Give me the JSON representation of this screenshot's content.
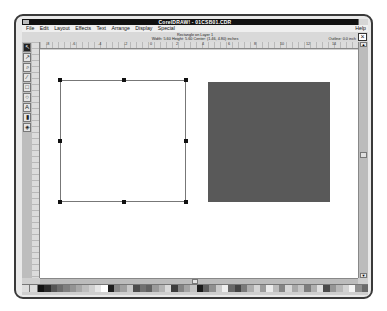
{
  "window": {
    "title": "CorelDRAW! - 01CSB01.CDR"
  },
  "menu": {
    "items": [
      "File",
      "Edit",
      "Layout",
      "Effects",
      "Text",
      "Arrange",
      "Display",
      "Special"
    ],
    "help": "Help"
  },
  "status": {
    "line1": "Rectangle on Layer 1",
    "line2": "Width: 5.60 Height: 5.60 Center: (1.46, 4.80) inches",
    "outline": "Outline: 0.0 inch"
  },
  "ruler": {
    "h_labels": [
      "-8",
      "-6",
      "-4",
      "-2",
      "0",
      "2",
      "4",
      "6",
      "8",
      "10",
      "12",
      "14"
    ],
    "units": "inches"
  },
  "toolbox": {
    "tools": [
      {
        "name": "pick-tool",
        "glyph": "↖"
      },
      {
        "name": "shape-tool",
        "glyph": "↗"
      },
      {
        "name": "zoom-tool",
        "glyph": "⌕"
      },
      {
        "name": "pencil-tool",
        "glyph": "∕"
      },
      {
        "name": "rectangle-tool",
        "glyph": "□"
      },
      {
        "name": "ellipse-tool",
        "glyph": "○"
      },
      {
        "name": "text-tool",
        "glyph": "A"
      },
      {
        "name": "outline-tool",
        "glyph": "▮"
      },
      {
        "name": "fill-tool",
        "glyph": "◈"
      }
    ]
  },
  "canvas": {
    "objects": [
      {
        "type": "rectangle",
        "state": "selected",
        "fill": "#ffffff",
        "outline": "#777777"
      },
      {
        "type": "rectangle",
        "state": "unselected",
        "fill": "#595959"
      }
    ]
  },
  "palette": {
    "colors": [
      "#111111",
      "#2a2a2a",
      "#555555",
      "#6b6b6b",
      "#7f7f7f",
      "#949494",
      "#a8a8a8",
      "#bdbdbd",
      "#d0d0d0",
      "#e6e6e6",
      "#ffffff",
      "#1e1e1e",
      "#888888",
      "#a0a0a0",
      "#c8c8c8",
      "#4c4c4c",
      "#707070",
      "#606060",
      "#9a9a9a",
      "#b4b4b4",
      "#dadada",
      "#3c3c3c",
      "#838383",
      "#a4a4a4",
      "#c2c2c2",
      "#1a1a1a",
      "#5e5e5e",
      "#909090",
      "#cbcbcb",
      "#efefef",
      "#686868",
      "#444444",
      "#7a7a7a",
      "#aeaeae",
      "#d5d5d5",
      "#9c9c9c",
      "#ececec",
      "#bcbcbc",
      "#858585",
      "#d8d8d8",
      "#a9a9a9",
      "#c5c5c5",
      "#7d7d7d",
      "#b0b0b0",
      "#e0e0e0",
      "#4a4a4a",
      "#969696",
      "#b8b8b8",
      "#d2d2d2",
      "#f4f4f4",
      "#8e8e8e",
      "#6a6a6a"
    ]
  }
}
